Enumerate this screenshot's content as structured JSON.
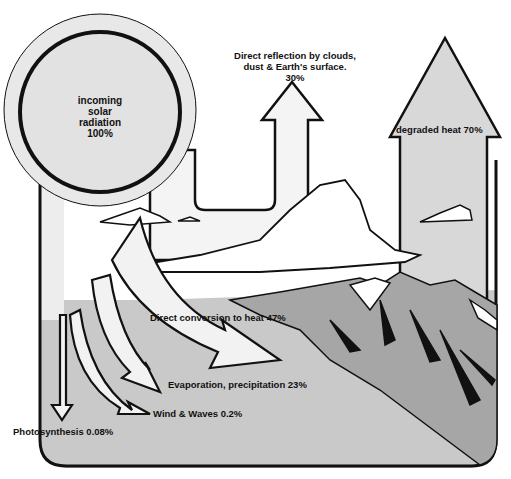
{
  "diagram": {
    "sun": {
      "line1": "incoming",
      "line2": "solar",
      "line3": "radiation",
      "line4": "100%"
    },
    "reflection": {
      "line1": "Direct reflection by clouds,",
      "line2": "dust & Earth's surface.",
      "line3": "30%"
    },
    "degraded_heat": "degraded heat 70%",
    "direct_conversion": "Direct conversion to heat 47%",
    "evaporation": "Evaporation, precipitation 23%",
    "wind_waves": "Wind & Waves 0.2%",
    "photosynthesis": "Photosynthesis 0.08%"
  },
  "colors": {
    "outline": "#111111",
    "arrow_fill": "#f2f2f2",
    "sun_fill": "#e4e4e4",
    "ground": "#c8c8c8",
    "mountain": "#a8a8a8",
    "big_arrow": "#d6d6d6"
  }
}
